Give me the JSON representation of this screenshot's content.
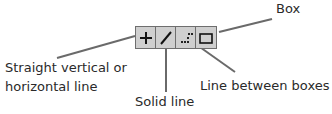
{
  "toolbar": {
    "buttons": [
      {
        "name": "straight-line-icon",
        "glyph": "+"
      },
      {
        "name": "solid-line-icon",
        "glyph": "/"
      },
      {
        "name": "line-between-boxes-icon",
        "glyph": "dotted"
      },
      {
        "name": "box-icon",
        "glyph": "rect"
      }
    ]
  },
  "labels": {
    "box": "Box",
    "straight_line_1": "Straight vertical or",
    "straight_line_2": "horizontal line",
    "solid_line": "Solid line",
    "line_between_boxes": "Line between boxes"
  },
  "colors": {
    "leader": "#6a6a6a",
    "button_bg": "#cfcfcf",
    "border": "#6e6e6e"
  }
}
